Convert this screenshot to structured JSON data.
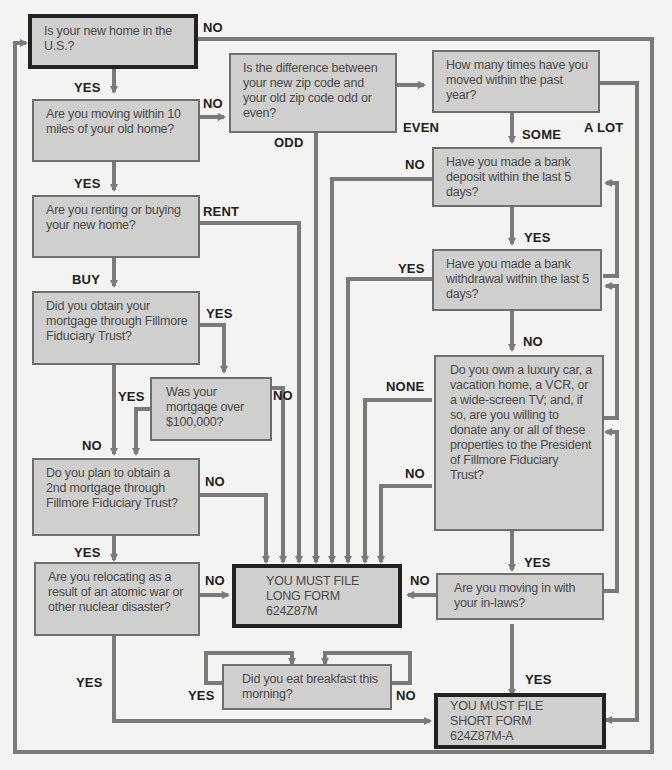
{
  "colors": {
    "line": "#7a7a7a",
    "box_fill": "#cfcfcd",
    "terminal_border": "#222222",
    "background": "#f3f3f1"
  },
  "nodes": {
    "q_us": "Is your new home in the U.S.?",
    "q_10miles": "Are you moving within 10 miles of your old home?",
    "q_zip": "Is the difference between your new zip code and your old zip code odd or even?",
    "q_times": "How many times have you moved within the past year?",
    "q_rent": "Are you renting or buying your new home?",
    "q_deposit": "Have you made a bank deposit within the last 5 days?",
    "q_mortgage_fft": "Did you obtain your mortgage through Fillmore Fiduciary Trust?",
    "q_withdrawal": "Have you made a bank withdrawal within the last 5 days?",
    "q_100k": "Was your mortgage over $100,000?",
    "q_luxury": "Do you own a luxury car, a vacation home, a VCR, or a wide-screen TV; and, if so, are you willing to donate any or all of these properties to the President of Fillmore Fiduciary Trust?",
    "q_2nd": "Do you plan to obtain a 2nd mortgage through Fillmore Fiduciary Trust?",
    "q_atomic": "Are you relocating as a result of an atomic war or other nuclear disaster?",
    "long_form": "YOU MUST FILE LONG FORM 624Z87M",
    "q_inlaws": "Are you moving in with your in-laws?",
    "q_breakfast": "Did you eat breakfast this morning?",
    "short_form": "YOU MUST FILE SHORT FORM 624Z87M-A"
  },
  "labels": {
    "us_no": "NO",
    "us_yes": "YES",
    "miles_no": "NO",
    "miles_yes": "YES",
    "zip_odd": "ODD",
    "zip_even": "EVEN",
    "times_some": "SOME",
    "times_alot": "A LOT",
    "rent_rent": "RENT",
    "rent_buy": "BUY",
    "deposit_no": "NO",
    "deposit_yes": "YES",
    "fft_yes": "YES",
    "withdrawal_yes": "YES",
    "withdrawal_no": "NO",
    "k100_yes": "YES",
    "k100_no": "NO",
    "fft_no": "NO",
    "luxury_none": "NONE",
    "luxury_no": "NO",
    "luxury_yes": "YES",
    "second_no": "NO",
    "second_yes": "YES",
    "atomic_no": "NO",
    "atomic_yes": "YES",
    "inlaws_no": "NO",
    "inlaws_yes": "YES",
    "breakfast_yes": "YES",
    "breakfast_no": "NO"
  }
}
